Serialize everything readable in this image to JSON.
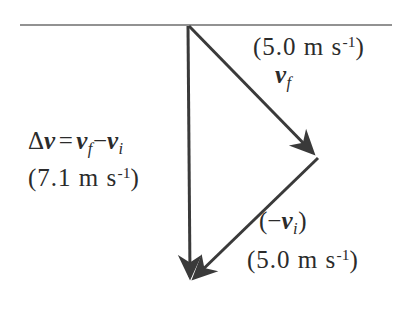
{
  "figure": {
    "background_color": "#ffffff",
    "stroke_color": "#3a3a3a",
    "baseline_color": "#6e6e6e"
  },
  "labels": {
    "v_final": {
      "magnitude": "(5.0 m s",
      "magnitude_exponent": "-1",
      "magnitude_close": ")",
      "symbol": "v",
      "symbol_subscript": "f"
    },
    "delta_v": {
      "delta": "Δ",
      "symbol": "v",
      "equals": "=",
      "term1": "v",
      "term1_subscript": "f",
      "minus": "−",
      "term2": "v",
      "term2_subscript": "i",
      "magnitude": "(7.1 m s",
      "magnitude_exponent": "-1",
      "magnitude_close": ")"
    },
    "neg_v_initial": {
      "open": "(",
      "minus": "−",
      "symbol": "v",
      "symbol_subscript": "i",
      "close": ")",
      "magnitude": "(5.0 m s",
      "magnitude_exponent": "-1",
      "magnitude_close": ")"
    }
  },
  "geometry": {
    "baseline": {
      "x1": 20,
      "y1": 25,
      "x2": 392,
      "y2": 25
    },
    "delta_v_arrow": {
      "x1": 188,
      "y1": 26,
      "x2": 190,
      "y2": 282
    },
    "v_final_arrow": {
      "x1": 189,
      "y1": 26,
      "x2": 318,
      "y2": 158
    },
    "neg_v_initial_arrow": {
      "x1": 318,
      "y1": 158,
      "x2": 190,
      "y2": 282
    }
  }
}
